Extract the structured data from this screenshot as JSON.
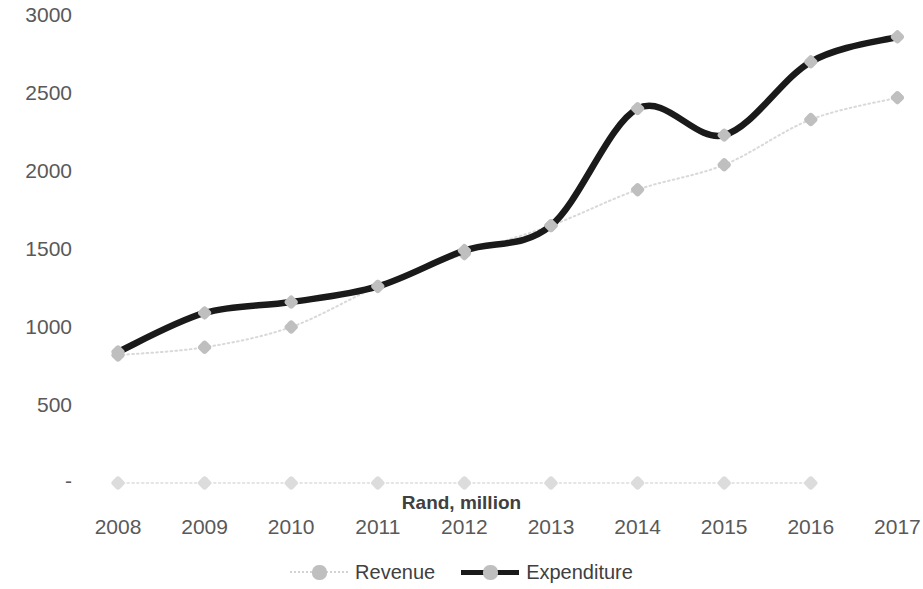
{
  "chart_data": {
    "type": "line",
    "title": "",
    "subtitle": "",
    "xlabel": "Rand, million",
    "ylabel": "",
    "categories": [
      "2008",
      "2009",
      "2010",
      "2011",
      "2012",
      "2013",
      "2014",
      "2015",
      "2016",
      "2017"
    ],
    "ylim": [
      0,
      3000
    ],
    "xlim": [
      "2008",
      "2017"
    ],
    "y_ticks": [
      "-",
      "500",
      "1000",
      "1500",
      "2000",
      "2500",
      "3000"
    ],
    "y_tick_values": [
      0,
      500,
      1000,
      1500,
      2000,
      2500,
      3000
    ],
    "grid": false,
    "legend_position": "bottom",
    "series": [
      {
        "name": "Revenue",
        "color": "#d9d9d9",
        "marker": "diamond",
        "marker_color": "#bfbfbf",
        "line_style": "dotted",
        "values": [
          820,
          870,
          1000,
          1260,
          1470,
          1650,
          1880,
          2040,
          2330,
          2470
        ]
      },
      {
        "name": "Expenditure",
        "color": "#1a1a1a",
        "marker": "diamond",
        "marker_color": "#bfbfbf",
        "line_style": "solid",
        "values": [
          840,
          1090,
          1160,
          1260,
          1490,
          1650,
          2400,
          2230,
          2700,
          2860
        ]
      },
      {
        "name": "",
        "color": "#e5e5e5",
        "marker": "diamond",
        "marker_color": "#d9d9d9",
        "line_style": "dotted",
        "values": [
          0,
          0,
          0,
          0,
          0,
          0,
          0,
          0,
          0,
          null
        ]
      }
    ]
  },
  "legend": {
    "items": [
      {
        "label": "Revenue"
      },
      {
        "label": "Expenditure"
      }
    ]
  },
  "axis": {
    "x_title": "Rand, million"
  },
  "colors": {
    "expenditure": "#1a1a1a",
    "revenue": "#d9d9d9",
    "marker": "#bfbfbf",
    "tick_text": "#595959",
    "title_text": "#404040",
    "background": "#ffffff"
  }
}
